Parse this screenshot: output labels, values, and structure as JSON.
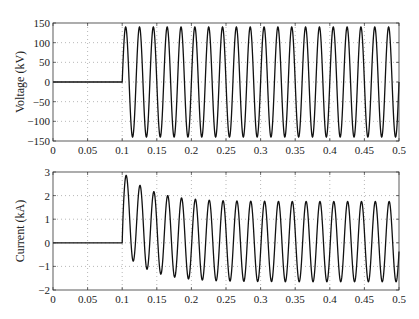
{
  "chart_data": [
    {
      "type": "line",
      "title": "",
      "xlabel": "",
      "ylabel": "Voltage (kV)",
      "xlim": [
        0,
        0.5
      ],
      "ylim": [
        -150,
        150
      ],
      "xticks": [
        "0",
        "0.05",
        "0.1",
        "0.15",
        "0.2",
        "0.25",
        "0.3",
        "0.35",
        "0.4",
        "0.45",
        "0.5"
      ],
      "yticks": [
        "150",
        "100",
        "50",
        "0",
        "-50",
        "-100",
        "-150"
      ],
      "grid": true,
      "series": [
        {
          "name": "Voltage",
          "description": "Zero until t=0.1 s, then 50 Hz sinusoid with ~140 kV amplitude",
          "switch_time": 0.1,
          "frequency_hz": 50,
          "amplitude": 140,
          "dc_offset": 0,
          "decay_tau": 0
        }
      ]
    },
    {
      "type": "line",
      "title": "",
      "xlabel": "",
      "ylabel": "Current (kA)",
      "xlim": [
        0,
        0.5
      ],
      "ylim": [
        -2,
        3
      ],
      "xticks": [
        "0",
        "0.05",
        "0.1",
        "0.15",
        "0.2",
        "0.25",
        "0.3",
        "0.35",
        "0.4",
        "0.45",
        "0.5"
      ],
      "yticks": [
        "3",
        "2",
        "1",
        "0",
        "-1",
        "-2"
      ],
      "grid": true,
      "series": [
        {
          "name": "Current",
          "description": "Zero until t=0.1 s, then 50 Hz sinusoid ~1.7 kA amplitude with decaying DC offset; first peak ~2.95 kA, first trough ~-0.9 kA",
          "switch_time": 0.1,
          "frequency_hz": 50,
          "amplitude": 1.7,
          "dc_offset": 1.3,
          "decay_tau": 0.04
        }
      ]
    }
  ]
}
